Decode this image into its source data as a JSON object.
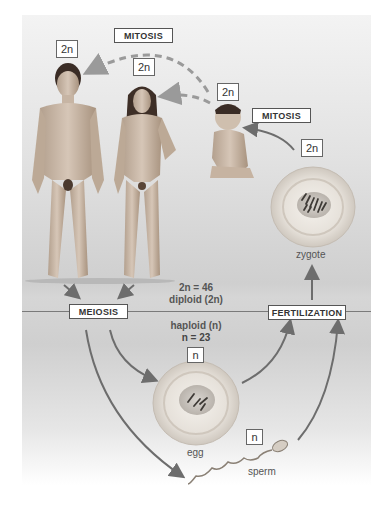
{
  "diagram": {
    "processes": {
      "mitosis_top": "MITOSIS",
      "mitosis_right": "MITOSIS",
      "meiosis": "MEIOSIS",
      "fertilization": "FERTILIZATION"
    },
    "ploidy_labels": {
      "man": "2n",
      "woman": "2n",
      "baby": "2n",
      "zygote": "2n",
      "egg": "n",
      "sperm": "n"
    },
    "diploid_text": [
      "2n = 46",
      "diploid (2n)"
    ],
    "haploid_text": [
      "haploid (n)",
      "n = 23"
    ],
    "captions": {
      "zygote": "zygote",
      "egg": "egg",
      "sperm": "sperm"
    },
    "figures": [
      "man",
      "woman",
      "baby",
      "zygote",
      "egg",
      "sperm"
    ],
    "colors": {
      "arrow": "#6d6d6d",
      "dashed_arrow": "#9a9a9a",
      "skin": "#c9b8a8",
      "cell": "#e4e0da"
    }
  }
}
